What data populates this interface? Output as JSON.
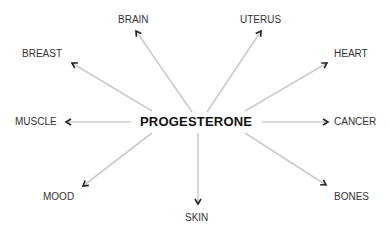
{
  "center": {
    "label": "PROGESTERONE"
  },
  "targets": [
    {
      "id": "brain",
      "label": "BRAIN"
    },
    {
      "id": "uterus",
      "label": "UTERUS"
    },
    {
      "id": "breast",
      "label": "BREAST"
    },
    {
      "id": "heart",
      "label": "HEART"
    },
    {
      "id": "muscle",
      "label": "MUSCLE"
    },
    {
      "id": "cancer",
      "label": "CANCER"
    },
    {
      "id": "mood",
      "label": "MOOD"
    },
    {
      "id": "bones",
      "label": "BONES"
    },
    {
      "id": "skin",
      "label": "SKIN"
    }
  ],
  "colors": {
    "arrow_line": "#cccccc",
    "arrow_head": "#222222",
    "text": "#333333",
    "center_text": "#111111"
  }
}
